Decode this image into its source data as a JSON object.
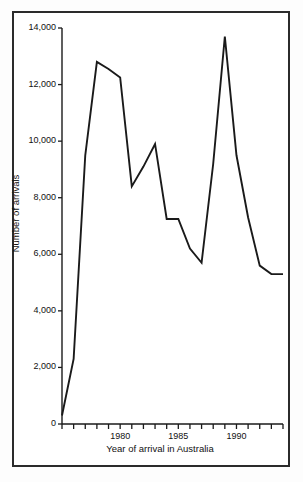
{
  "chart_data": {
    "type": "line",
    "title": "",
    "xlabel": "Year of arrival in Australia",
    "ylabel": "Number of arrivals",
    "xlim": [
      1975,
      1994
    ],
    "ylim": [
      0,
      14000
    ],
    "grid": false,
    "legend": "none",
    "ytick_labels": [
      "14,000",
      "12,000",
      "10,000",
      "8,000",
      "6,000",
      "4,000",
      "2,000",
      "0"
    ],
    "ytick_values": [
      14000,
      12000,
      10000,
      8000,
      6000,
      4000,
      2000,
      0
    ],
    "xtick_labels": [
      "1980",
      "1985",
      "1990"
    ],
    "xtick_values": [
      1980,
      1985,
      1990
    ],
    "xtick_minor_values": [
      1975,
      1976,
      1977,
      1978,
      1979,
      1981,
      1982,
      1983,
      1984,
      1986,
      1987,
      1988,
      1989,
      1991,
      1992,
      1993,
      1994
    ],
    "x": [
      1975,
      1976,
      1977,
      1978,
      1979,
      1980,
      1981,
      1982,
      1983,
      1984,
      1985,
      1986,
      1987,
      1988,
      1989,
      1990,
      1991,
      1992,
      1993,
      1994
    ],
    "values": [
      300,
      2300,
      9500,
      12800,
      12550,
      12250,
      8400,
      9100,
      9900,
      7250,
      7250,
      6200,
      5700,
      9200,
      13700,
      9500,
      7300,
      5600,
      5300,
      5300
    ],
    "series": [
      {
        "name": "Number of arrivals",
        "color": "#1a1a1a",
        "values": [
          300,
          2300,
          9500,
          12800,
          12550,
          12250,
          8400,
          9100,
          9900,
          7250,
          7250,
          6200,
          5700,
          9200,
          13700,
          9500,
          7300,
          5600,
          5300,
          5300
        ]
      }
    ]
  },
  "axes": {
    "line_color": "#1a1a1a",
    "frame_color": "#2b2b2b",
    "background": "#ffffff"
  }
}
